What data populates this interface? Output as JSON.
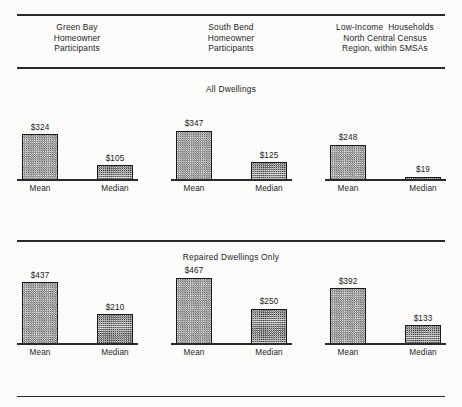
{
  "figure": {
    "columns": [
      {
        "lines": [
          "Green Bay",
          "Homeowner",
          "Participants"
        ]
      },
      {
        "lines": [
          "South Bend",
          "Homeowner",
          "Participants"
        ]
      },
      {
        "lines": [
          "Low-Income  Households",
          "North Central Census",
          "Region, within SMSAs"
        ]
      }
    ],
    "panels": [
      {
        "title": "All Dwellings"
      },
      {
        "title": "Repaired Dwellings Only"
      }
    ],
    "category_labels": [
      "Mean",
      "Median"
    ]
  },
  "chart_data": {
    "type": "bar",
    "title": "",
    "xlabel": "",
    "ylabel": "",
    "value_prefix": "$",
    "grid": false,
    "legend": "none",
    "panels": [
      {
        "title": "All Dwellings",
        "categories": [
          "Mean",
          "Median"
        ],
        "groups": [
          {
            "name": "Green Bay Homeowner Participants",
            "values": [
              324,
              105
            ],
            "labels": [
              "$324",
              "$105"
            ]
          },
          {
            "name": "South Bend Homeowner Participants",
            "values": [
              347,
              125
            ],
            "labels": [
              "$347",
              "$125"
            ]
          },
          {
            "name": "Low-Income Households North Central Census Region, within SMSAs",
            "values": [
              248,
              19
            ],
            "labels": [
              "$248",
              "$19"
            ]
          }
        ]
      },
      {
        "title": "Repaired Dwellings Only",
        "categories": [
          "Mean",
          "Median"
        ],
        "groups": [
          {
            "name": "Green Bay Homeowner Participants",
            "values": [
              437,
              210
            ],
            "labels": [
              "$437",
              "$210"
            ]
          },
          {
            "name": "South Bend Homeowner Participants",
            "values": [
              467,
              250
            ],
            "labels": [
              "$467",
              "$250"
            ]
          },
          {
            "name": "Low-Income Households North Central Census Region, within SMSAs",
            "values": [
              392,
              133
            ],
            "labels": [
              "$392",
              "$133"
            ]
          }
        ]
      }
    ]
  },
  "style": {
    "bar_outline": "#1a1a1a",
    "rule_color": "#2a2a2a",
    "background": "#fbfbfa",
    "text_color": "#1f1f1f"
  }
}
